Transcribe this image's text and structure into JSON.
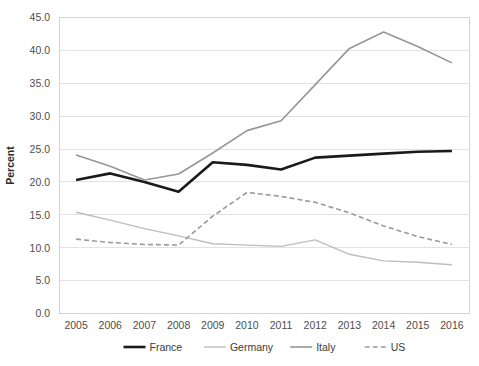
{
  "chart_data": {
    "type": "line",
    "title": "",
    "xlabel": "",
    "ylabel": "Percent",
    "categories": [
      "2005",
      "2006",
      "2007",
      "2008",
      "2009",
      "2010",
      "2011",
      "2012",
      "2013",
      "2014",
      "2015",
      "2016"
    ],
    "x": [
      2005,
      2006,
      2007,
      2008,
      2009,
      2010,
      2011,
      2012,
      2013,
      2014,
      2015,
      2016
    ],
    "ylim": [
      0.0,
      45.0
    ],
    "ytick_step": 5.0,
    "yticks": [
      "0.0",
      "5.0",
      "10.0",
      "15.0",
      "20.0",
      "25.0",
      "30.0",
      "35.0",
      "40.0",
      "45.0"
    ],
    "grid": true,
    "legend_position": "bottom",
    "series": [
      {
        "name": "France",
        "color": "#1a1a1a",
        "width": 2.6,
        "dash": "none",
        "values": [
          20.3,
          21.3,
          20.0,
          18.5,
          23.0,
          22.6,
          21.9,
          23.7,
          24.0,
          24.3,
          24.6,
          24.7
        ]
      },
      {
        "name": "Germany",
        "color": "#bdbdbd",
        "width": 1.4,
        "dash": "none",
        "values": [
          15.4,
          14.2,
          12.9,
          11.8,
          10.6,
          10.4,
          10.2,
          11.2,
          9.0,
          8.0,
          7.8,
          7.4
        ]
      },
      {
        "name": "Italy",
        "color": "#969696",
        "width": 1.6,
        "dash": "none",
        "values": [
          24.1,
          22.4,
          20.3,
          21.2,
          24.4,
          27.8,
          29.3,
          34.8,
          40.3,
          42.8,
          40.6,
          38.1
        ]
      },
      {
        "name": "US",
        "color": "#9a9a9a",
        "width": 1.6,
        "dash": "5,3",
        "values": [
          11.3,
          10.8,
          10.5,
          10.4,
          14.8,
          18.4,
          17.8,
          16.9,
          15.3,
          13.3,
          11.7,
          10.5
        ]
      }
    ]
  },
  "legend": {
    "items": [
      {
        "label": "France"
      },
      {
        "label": "Germany"
      },
      {
        "label": "Italy"
      },
      {
        "label": "US"
      }
    ]
  },
  "style": {
    "grid_color": "#e2e2e2",
    "frame_color": "#d4d4d4",
    "background": "#ffffff",
    "text_color": "#3a3a3a"
  }
}
